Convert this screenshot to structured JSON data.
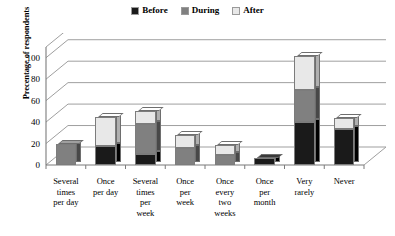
{
  "chart_data": {
    "type": "bar",
    "subtype": "stacked-column-3d",
    "title": "",
    "xlabel": "",
    "ylabel": "Precentage of respondents",
    "ylim": [
      0,
      100
    ],
    "yticks": [
      0,
      20,
      40,
      60,
      80,
      100
    ],
    "grid": true,
    "legend_position": "top-center",
    "categories": [
      "Several times per day",
      "Once per day",
      "Several times per week",
      "Once per week",
      "Once every two weeks",
      "Once per month",
      "Very rarely",
      "Never"
    ],
    "category_lines": [
      [
        "Several",
        "times",
        "per day"
      ],
      [
        "Once",
        "per day"
      ],
      [
        "Several",
        "times",
        "per",
        "week"
      ],
      [
        "Once",
        "per",
        "week"
      ],
      [
        "Once",
        "every",
        "two",
        "weeks"
      ],
      [
        "Once",
        "per",
        "month"
      ],
      [
        "Very",
        "rarely"
      ],
      [
        "Never"
      ]
    ],
    "series": [
      {
        "name": "Before",
        "color": "#1a1a1a",
        "values": [
          0,
          18,
          10,
          0,
          0,
          7,
          40,
          34
        ]
      },
      {
        "name": "During",
        "color": "#808080",
        "values": [
          20,
          0,
          28,
          16,
          9,
          0,
          30,
          0
        ]
      },
      {
        "name": "After",
        "color": "#e8e8e8",
        "values": [
          0,
          27,
          12,
          12,
          10,
          0,
          32,
          10
        ]
      }
    ],
    "totals": [
      20,
      45,
      50,
      28,
      19,
      7,
      102,
      44
    ]
  },
  "legend": {
    "items": [
      {
        "label": "Before",
        "color": "#1a1a1a"
      },
      {
        "label": "During",
        "color": "#808080"
      },
      {
        "label": "After",
        "color": "#e8e8e8"
      }
    ]
  },
  "axis": {
    "y_title": "Precentage of respondents",
    "y_ticks": [
      "100",
      "80",
      "60",
      "40",
      "20",
      "0"
    ]
  }
}
